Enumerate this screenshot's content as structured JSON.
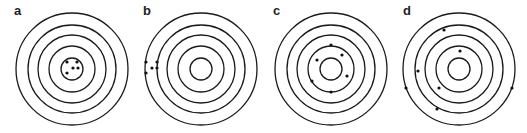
{
  "figure": {
    "panels": [
      {
        "label": "a",
        "cx": 72,
        "cy": 69,
        "radii": [
          56,
          44,
          34,
          23,
          11
        ],
        "dots": [
          [
            67,
            62
          ],
          [
            77,
            62
          ],
          [
            73,
            68
          ],
          [
            78,
            68
          ],
          [
            67,
            73
          ]
        ]
      },
      {
        "label": "b",
        "cx": 201,
        "cy": 69,
        "radii": [
          56,
          44,
          34,
          23,
          11
        ],
        "dots": [
          [
            146,
            62
          ],
          [
            146,
            73
          ],
          [
            152,
            68
          ],
          [
            157,
            62
          ],
          [
            157,
            68
          ]
        ]
      },
      {
        "label": "c",
        "cx": 331,
        "cy": 69,
        "radii": [
          56,
          44,
          34,
          23,
          11
        ],
        "dots": [
          [
            331,
            45
          ],
          [
            342,
            55
          ],
          [
            317,
            60
          ],
          [
            347,
            76
          ],
          [
            312,
            81
          ],
          [
            331,
            92
          ]
        ]
      },
      {
        "label": "d",
        "cx": 459,
        "cy": 69,
        "radii": [
          56,
          44,
          34,
          23,
          11
        ],
        "dots": [
          [
            444,
            30
          ],
          [
            460,
            51
          ],
          [
            418,
            71
          ],
          [
            406,
            88
          ],
          [
            439,
            88
          ],
          [
            512,
            88
          ],
          [
            437,
            109
          ]
        ]
      }
    ],
    "colors": {
      "ring": "#1a1a1a",
      "dot": "#111111",
      "label": "#222222"
    }
  }
}
